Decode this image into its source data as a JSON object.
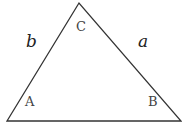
{
  "diagram": {
    "type": "triangle",
    "vertices": {
      "A": {
        "label": "A",
        "x": 7,
        "y": 121
      },
      "B": {
        "label": "B",
        "x": 181,
        "y": 121
      },
      "C": {
        "label": "C",
        "x": 79,
        "y": 3
      }
    },
    "sides": {
      "a": {
        "label": "a",
        "between": [
          "C",
          "B"
        ]
      },
      "b": {
        "label": "b",
        "between": [
          "A",
          "C"
        ]
      }
    },
    "stroke_color": "#333333"
  }
}
